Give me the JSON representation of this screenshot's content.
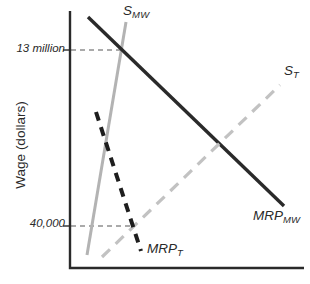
{
  "chart_data": {
    "type": "line",
    "title": "",
    "xlabel": "",
    "ylabel": "Wage (dollars)",
    "axis_color": "#2a2a2a",
    "guide_color": "#8f8f8f",
    "series": [
      {
        "name": "S_MW",
        "label_main": "S",
        "label_sub": "MW",
        "style": "solid",
        "color": "#b3b3b3",
        "width": 3,
        "dash": "",
        "x1": 126,
        "y1": 22,
        "x2": 87,
        "y2": 255,
        "description": "steep upward-sloping supply curve"
      },
      {
        "name": "MRP_MW",
        "label_main": "MRP",
        "label_sub": "MW",
        "style": "solid",
        "color": "#2a2a2a",
        "width": 3.4,
        "dash": "",
        "x1": 88,
        "y1": 17,
        "x2": 284,
        "y2": 206,
        "description": "downward-sloping marginal revenue product curve"
      },
      {
        "name": "S_T",
        "label_main": "S",
        "label_sub": "T",
        "style": "dashed",
        "color": "#c2c2c2",
        "width": 3.2,
        "dash": "11 8",
        "x1": 102,
        "y1": 257,
        "x2": 280,
        "y2": 85,
        "description": "upward-sloping supply curve"
      },
      {
        "name": "MRP_T",
        "label_main": "MRP",
        "label_sub": "T",
        "style": "dashed",
        "color": "#1e1e1e",
        "width": 4,
        "dash": "9 7",
        "x1": 96,
        "y1": 112,
        "x2": 141,
        "y2": 251,
        "description": "steep downward-sloping marginal revenue product curve"
      }
    ],
    "guides": [
      {
        "label": "13 million",
        "y": 50,
        "x_start": 71,
        "x_end": 121,
        "at_intersection_of": [
          "S_MW",
          "MRP_MW"
        ]
      },
      {
        "label": "40,000",
        "y": 226,
        "x_start": 71,
        "x_end": 134,
        "at_intersection_of": [
          "S_T",
          "MRP_T"
        ]
      }
    ],
    "axes": {
      "y_axis": {
        "x": 70,
        "y_top": 11,
        "y_bottom": 268,
        "label": "Wage (dollars)"
      },
      "x_axis": {
        "y": 268,
        "x_left": 70,
        "x_right": 304,
        "label": ""
      }
    },
    "legend": "none"
  }
}
